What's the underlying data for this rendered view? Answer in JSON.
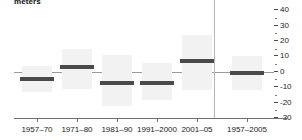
{
  "chart_data": {
    "type": "bar",
    "title": "meters",
    "xlabel": "",
    "ylabel": "meters",
    "ylim": [
      -30,
      40
    ],
    "yticks": [
      40,
      30,
      20,
      10,
      0,
      -10,
      -20,
      -30
    ],
    "ytick_labels": [
      "40",
      "30",
      "20",
      "10",
      "0",
      "-10",
      "-20",
      "-30"
    ],
    "grid": false,
    "legend": "none",
    "zero_line": 0,
    "categories": [
      "1957–70",
      "1971–80",
      "1981–90",
      "1991–2000",
      "2001–05",
      "1957–2005"
    ],
    "values": [
      -5,
      3,
      -7,
      -7,
      7,
      -1
    ],
    "ranges": [
      {
        "low": -13,
        "high": 4
      },
      {
        "low": -11,
        "high": 15
      },
      {
        "low": -22,
        "high": 11
      },
      {
        "low": -18,
        "high": 6
      },
      {
        "low": -12,
        "high": 24
      },
      {
        "low": -12,
        "high": 10
      }
    ],
    "series": [
      {
        "name": "trend",
        "values": [
          -5,
          3,
          -7,
          -7,
          7,
          -1
        ]
      }
    ],
    "annotations": [],
    "separator_after_index": 4
  }
}
